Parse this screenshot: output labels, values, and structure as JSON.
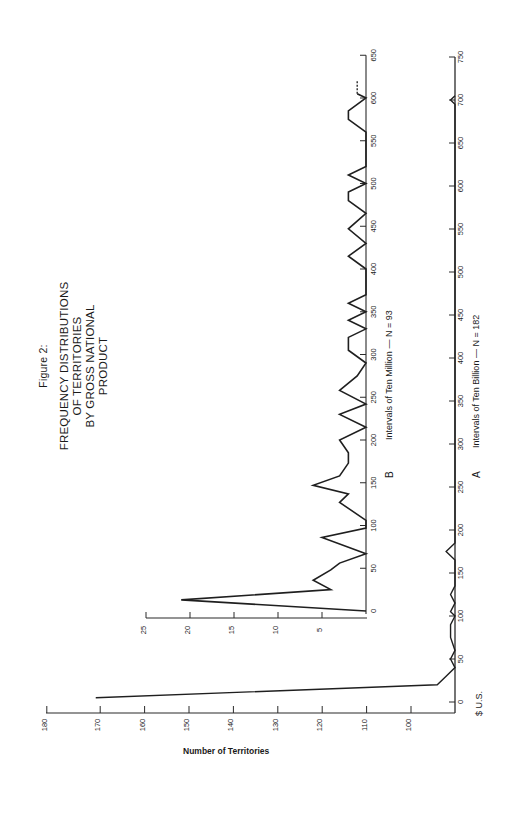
{
  "title": {
    "figure": "Figure 2:",
    "line1": "FREQUENCY DISTRIBUTIONS",
    "line2": "OF TERRITORIES",
    "line3": "BY GROSS NATIONAL PRODUCT"
  },
  "labels": {
    "y_axis_title": "Number of Territories",
    "currency": "$ U.S.",
    "panel_b_letter": "B",
    "panel_b_axis": "Intervals of Ten Million — N = 93",
    "panel_a_letter": "A",
    "panel_a_axis": "Intervals of Ten Billion — N = 182"
  },
  "colors": {
    "line": "#1f1f1f",
    "axis": "#2a2a2a",
    "background": "#ffffff"
  },
  "chart_data": [
    {
      "id": "B",
      "type": "line",
      "title": "B: Intervals of Ten Million — N = 93",
      "xlabel": "Intervals of Ten Million (GNP, $ U.S.)",
      "ylabel": "Number of Territories",
      "xlim": [
        0,
        650
      ],
      "ylim": [
        0,
        25
      ],
      "x_ticks": [
        0,
        50,
        100,
        150,
        200,
        250,
        300,
        350,
        400,
        450,
        500,
        550,
        600,
        650
      ],
      "y_ticks": [
        5,
        10,
        15,
        20,
        25
      ],
      "x": [
        0,
        13,
        25,
        36,
        48,
        56,
        67,
        86,
        97,
        106,
        120,
        127,
        137,
        147,
        158,
        173,
        185,
        200,
        215,
        230,
        242,
        258,
        275,
        290,
        305,
        320,
        330,
        340,
        350,
        360,
        370,
        400,
        415,
        430,
        447,
        465,
        480,
        490,
        500,
        510,
        520,
        560,
        575,
        585,
        600,
        605
      ],
      "values": [
        0,
        21,
        4,
        6,
        4,
        3,
        0,
        5,
        0,
        0,
        2,
        3,
        2,
        6,
        3,
        2,
        2,
        3,
        0,
        3,
        0,
        3,
        1,
        0,
        2,
        2,
        0,
        2,
        0,
        2,
        0,
        0,
        2,
        0,
        2,
        0,
        2,
        2,
        0,
        2,
        0,
        0,
        2,
        2,
        0,
        1
      ],
      "dashed_continuation": {
        "from": 605,
        "to": 620
      },
      "grid": false
    },
    {
      "id": "A",
      "type": "line",
      "title": "A: Intervals of Ten Billion — N = 182",
      "xlabel": "Intervals of Ten Billion (GNP, $ U.S.)",
      "ylabel": "Number of Territories",
      "xlim": [
        0,
        750
      ],
      "ylim": [
        0,
        180
      ],
      "axis_break": "count axis broken between ~10 and 100",
      "x_ticks": [
        0,
        50,
        100,
        150,
        200,
        250,
        300,
        350,
        400,
        450,
        500,
        550,
        600,
        650,
        700,
        750
      ],
      "y_ticks": [
        100,
        110,
        120,
        130,
        140,
        150,
        160,
        170,
        180
      ],
      "x": [
        5,
        20,
        30,
        40,
        50,
        60,
        75,
        90,
        100,
        105,
        115,
        125,
        135,
        165,
        175,
        185,
        695,
        700,
        705
      ],
      "values": [
        171,
        4,
        2,
        0,
        1,
        0,
        1,
        1,
        0,
        1,
        0,
        1,
        0,
        0,
        2,
        0,
        0,
        1,
        0
      ],
      "grid": false
    }
  ]
}
